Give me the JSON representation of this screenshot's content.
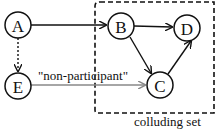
{
  "diagram": {
    "nodes": [
      {
        "id": "A",
        "label": "A"
      },
      {
        "id": "B",
        "label": "B"
      },
      {
        "id": "C",
        "label": "C"
      },
      {
        "id": "D",
        "label": "D"
      },
      {
        "id": "E",
        "label": "E"
      }
    ],
    "edges": [
      {
        "from": "A",
        "to": "B",
        "style": "solid"
      },
      {
        "from": "A",
        "to": "E",
        "style": "dotted"
      },
      {
        "from": "B",
        "to": "D",
        "style": "solid"
      },
      {
        "from": "B",
        "to": "C",
        "style": "solid"
      },
      {
        "from": "C",
        "to": "D",
        "style": "solid"
      },
      {
        "from": "E",
        "to": "C",
        "style": "solid-gray",
        "label": "\"non-participant\""
      }
    ],
    "group": {
      "label": "colluding set",
      "members": [
        "B",
        "C",
        "D"
      ],
      "style": "dashed"
    },
    "colors": {
      "stroke": "#111111",
      "gray_edge": "#888888"
    }
  }
}
